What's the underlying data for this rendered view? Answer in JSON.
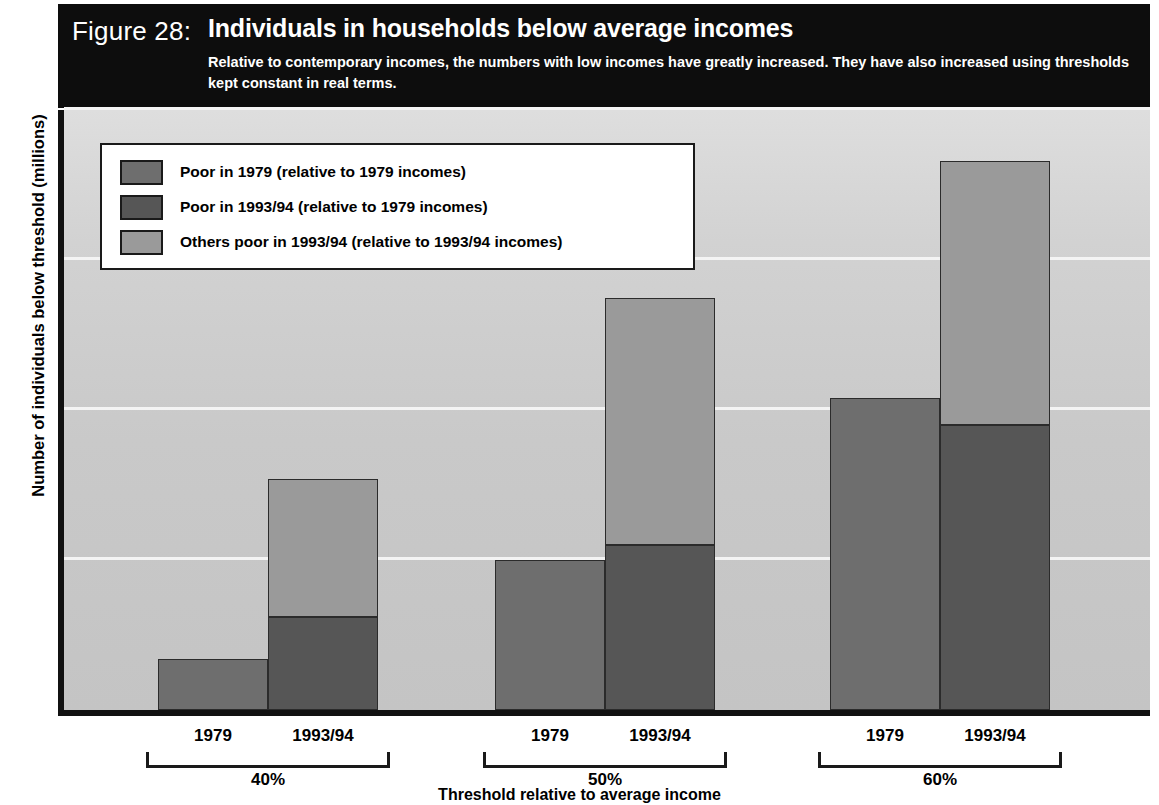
{
  "figure": {
    "label": "Figure 28:",
    "title": "Individuals in households below average incomes",
    "subtitle": "Relative to contemporary incomes, the numbers with low incomes have greatly increased. They have also increased using thresholds kept constant in real terms."
  },
  "colors": {
    "banner_background": "#0d0d0d",
    "banner_text": "#ffffff",
    "plot_background": "#c9c9c9",
    "gridline": "#f4f4f4",
    "axis": "#111111",
    "series_poor_1979": "#6e6e6e",
    "series_poor_1993_relative_1979": "#565656",
    "series_others_poor_1993": "#9a9a9a"
  },
  "chart_data": {
    "type": "bar",
    "title": "Individuals in households below average incomes",
    "xlabel": "Threshold relative to average income",
    "ylabel": "Number of individuals below threshold (millions)",
    "ylim": [
      0,
      20
    ],
    "yticks": [
      0,
      5,
      10,
      15,
      20
    ],
    "ytick_labels": [
      "0",
      "5",
      "10",
      "15",
      "20"
    ],
    "grid": true,
    "stacked": true,
    "legend_position": "top-left inside plot",
    "groups": [
      "40%",
      "50%",
      "60%"
    ],
    "subcategories": [
      "1979",
      "1993/94"
    ],
    "series": [
      {
        "name": "Poor in 1979 (relative to 1979 incomes)",
        "color": "#6e6e6e",
        "applies_to": "1979",
        "values": [
          1.7,
          5.0,
          10.4
        ]
      },
      {
        "name": "Poor in 1993/94 (relative to 1979 incomes)",
        "color": "#565656",
        "applies_to": "1993/94",
        "values": [
          3.1,
          5.5,
          9.5
        ]
      },
      {
        "name": "Others poor in 1993/94 (relative to 1993/94 incomes)",
        "color": "#9a9a9a",
        "applies_to": "1993/94",
        "values": [
          4.6,
          8.25,
          8.8
        ]
      }
    ],
    "stack_totals_1993_94": [
      7.7,
      13.75,
      18.3
    ],
    "bars": [
      {
        "group": "40%",
        "sub": "1979",
        "segments": [
          {
            "series": "Poor in 1979 (relative to 1979 incomes)",
            "value": 1.7
          }
        ],
        "total": 1.7
      },
      {
        "group": "40%",
        "sub": "1993/94",
        "segments": [
          {
            "series": "Poor in 1993/94 (relative to 1979 incomes)",
            "value": 3.1
          },
          {
            "series": "Others poor in 1993/94 (relative to 1993/94 incomes)",
            "value": 4.6
          }
        ],
        "total": 7.7
      },
      {
        "group": "50%",
        "sub": "1979",
        "segments": [
          {
            "series": "Poor in 1979 (relative to 1979 incomes)",
            "value": 5.0
          }
        ],
        "total": 5.0
      },
      {
        "group": "50%",
        "sub": "1993/94",
        "segments": [
          {
            "series": "Poor in 1993/94 (relative to 1979 incomes)",
            "value": 5.5
          },
          {
            "series": "Others poor in 1993/94 (relative to 1993/94 incomes)",
            "value": 8.25
          }
        ],
        "total": 13.75
      },
      {
        "group": "60%",
        "sub": "1979",
        "segments": [
          {
            "series": "Poor in 1979 (relative to 1979 incomes)",
            "value": 10.4
          }
        ],
        "total": 10.4
      },
      {
        "group": "60%",
        "sub": "1993/94",
        "segments": [
          {
            "series": "Poor in 1993/94 (relative to 1979 incomes)",
            "value": 9.5
          },
          {
            "series": "Others poor in 1993/94 (relative to 1993/94 incomes)",
            "value": 8.8
          }
        ],
        "total": 18.3
      }
    ]
  },
  "yaxis": {
    "title": "Number of individuals below threshold (millions)",
    "ticks": [
      "20",
      "15",
      "10",
      "5",
      "0"
    ]
  },
  "xaxis": {
    "title": "Threshold relative to average income",
    "groups": [
      {
        "label": "40%",
        "subs": [
          "1979",
          "1993/94"
        ]
      },
      {
        "label": "50%",
        "subs": [
          "1979",
          "1993/94"
        ]
      },
      {
        "label": "60%",
        "subs": [
          "1979",
          "1993/94"
        ]
      }
    ]
  },
  "legend": {
    "items": [
      {
        "label": "Poor in 1979 (relative to 1979 incomes)",
        "color": "#6e6e6e"
      },
      {
        "label": "Poor in 1993/94 (relative to 1979 incomes)",
        "color": "#565656"
      },
      {
        "label": "Others poor in 1993/94 (relative to 1993/94 incomes)",
        "color": "#9a9a9a"
      }
    ]
  }
}
